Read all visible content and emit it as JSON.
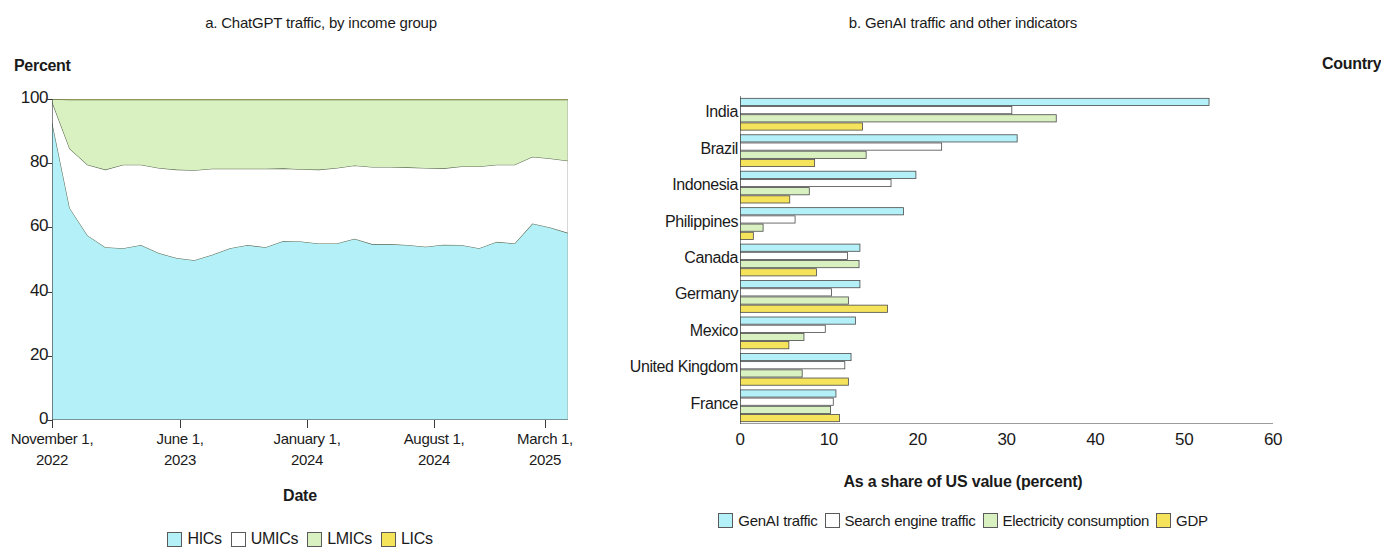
{
  "panel_a": {
    "title": "a. ChatGPT traffic, by income group",
    "y_axis_label": "Percent",
    "x_axis_label": "Date",
    "y_ticks": [
      "100",
      "80",
      "60",
      "40",
      "20",
      "0"
    ],
    "x_ticks": [
      {
        "line1": "November 1,",
        "line2": "2022"
      },
      {
        "line1": "June 1,",
        "line2": "2023"
      },
      {
        "line1": "January 1,",
        "line2": "2024"
      },
      {
        "line1": "August 1,",
        "line2": "2024"
      },
      {
        "line1": "March 1,",
        "line2": "2025"
      }
    ],
    "legend": [
      {
        "label": "HICs",
        "color": "#b3f0f7"
      },
      {
        "label": "UMICs",
        "color": "#ffffff"
      },
      {
        "label": "LMICs",
        "color": "#d9f0c0"
      },
      {
        "label": "LICs",
        "color": "#f5e35c"
      }
    ]
  },
  "panel_b": {
    "title": "b. GenAI traffic and other indicators",
    "y_axis_label": "Country",
    "x_axis_label": "As a share of US value (percent)",
    "x_ticks": [
      "0",
      "10",
      "20",
      "30",
      "40",
      "50",
      "60"
    ],
    "legend": [
      {
        "label": "GenAI traffic",
        "color": "#b3f0f7"
      },
      {
        "label": "Search engine traffic",
        "color": "#ffffff"
      },
      {
        "label": "Electricity consumption",
        "color": "#d9f0c0"
      },
      {
        "label": "GDP",
        "color": "#f5e35c"
      }
    ]
  },
  "chart_data": [
    {
      "type": "area",
      "stacked": true,
      "title": "a. ChatGPT traffic, by income group",
      "xlabel": "Date",
      "ylabel": "Percent",
      "ylim": [
        0,
        100
      ],
      "grid": false,
      "legend_position": "bottom",
      "x": [
        "November 1, 2022",
        "2022-12-01",
        "2023-01-01",
        "2023-02-01",
        "2023-03-01",
        "2023-04-01",
        "2023-05-01",
        "June 1, 2023",
        "2023-07-01",
        "2023-08-01",
        "2023-09-01",
        "2023-10-01",
        "2023-11-01",
        "2023-12-01",
        "January 1, 2024",
        "2024-02-01",
        "2024-03-01",
        "2024-04-01",
        "2024-05-01",
        "2024-06-01",
        "2024-07-01",
        "August 1, 2024",
        "2024-09-01",
        "2024-10-01",
        "2024-11-01",
        "2024-12-01",
        "2025-01-01",
        "2025-02-01",
        "March 1, 2025",
        "2025-04-01"
      ],
      "series": [
        {
          "name": "HICs",
          "color": "#b3f0f7",
          "values": [
            93.0,
            66.0,
            57.5,
            53.8,
            53.5,
            54.5,
            52.0,
            50.5,
            49.8,
            51.5,
            53.5,
            54.5,
            53.8,
            55.8,
            55.6,
            55.0,
            55.0,
            56.5,
            54.8,
            54.8,
            54.5,
            54.0,
            54.6,
            54.5,
            53.5,
            55.5,
            55.0,
            61.2,
            60.0,
            58.3
          ]
        },
        {
          "name": "UMICs",
          "color": "#ffffff",
          "values": [
            6.2,
            18.5,
            22.0,
            24.2,
            26.0,
            25.0,
            26.5,
            27.5,
            28.0,
            26.8,
            24.8,
            23.8,
            24.5,
            22.6,
            22.5,
            23.0,
            23.5,
            22.8,
            24.0,
            24.0,
            24.2,
            24.5,
            23.8,
            24.5,
            25.5,
            24.0,
            24.5,
            20.8,
            21.5,
            22.5
          ]
        },
        {
          "name": "LMICs",
          "color": "#d9f0c0",
          "values": [
            0.7,
            15.3,
            20.3,
            21.8,
            20.3,
            20.3,
            21.3,
            21.8,
            22.0,
            21.5,
            21.5,
            21.5,
            21.5,
            21.4,
            21.7,
            21.8,
            21.3,
            20.5,
            21.0,
            21.0,
            21.1,
            21.3,
            21.4,
            20.8,
            20.8,
            20.3,
            20.3,
            17.8,
            18.3,
            19.0
          ]
        },
        {
          "name": "LICs",
          "color": "#f5e35c",
          "values": [
            0.1,
            0.2,
            0.2,
            0.2,
            0.2,
            0.2,
            0.2,
            0.2,
            0.2,
            0.2,
            0.2,
            0.2,
            0.2,
            0.2,
            0.2,
            0.2,
            0.2,
            0.2,
            0.2,
            0.2,
            0.2,
            0.2,
            0.2,
            0.2,
            0.2,
            0.2,
            0.2,
            0.2,
            0.2,
            0.2
          ]
        }
      ]
    },
    {
      "type": "bar",
      "orientation": "horizontal",
      "grouped": true,
      "title": "b. GenAI traffic and other indicators",
      "xlabel": "As a share of US value (percent)",
      "ylabel": "Country",
      "xlim": [
        0,
        60
      ],
      "grid": false,
      "legend_position": "bottom",
      "categories": [
        "India",
        "Brazil",
        "Indonesia",
        "Philippines",
        "Canada",
        "Germany",
        "Mexico",
        "United Kingdom",
        "France"
      ],
      "series": [
        {
          "name": "GenAI traffic",
          "color": "#b3f0f7",
          "values": [
            52.8,
            31.2,
            19.8,
            18.4,
            13.5,
            13.5,
            13.0,
            12.5,
            10.8
          ]
        },
        {
          "name": "Search engine traffic",
          "color": "#ffffff",
          "values": [
            30.6,
            22.7,
            17.0,
            6.2,
            12.1,
            10.3,
            9.6,
            11.8,
            10.5
          ]
        },
        {
          "name": "Electricity consumption",
          "color": "#d9f0c0",
          "values": [
            35.6,
            14.2,
            7.8,
            2.6,
            13.4,
            12.2,
            7.2,
            7.0,
            10.2
          ]
        },
        {
          "name": "GDP",
          "color": "#f5e35c",
          "values": [
            13.8,
            8.4,
            5.6,
            1.5,
            8.6,
            16.6,
            5.5,
            12.2,
            11.2
          ]
        }
      ]
    }
  ]
}
